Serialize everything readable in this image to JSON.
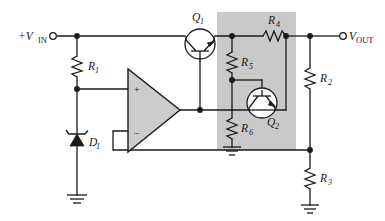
{
  "figure": {
    "name": "series-voltage-regulator-with-current-limiting",
    "background_color": "#ffffff",
    "line_color": "#1a1a1a",
    "shade_color": "#c9c9c9",
    "opamp_fill": "#cccccc"
  },
  "terminals": {
    "input": {
      "label": "+V",
      "subscript": "IN",
      "full": "+VIN"
    },
    "output": {
      "label": "V",
      "subscript": "OUT",
      "full": "VOUT"
    }
  },
  "components": {
    "r1": {
      "label": "R",
      "subscript": "1",
      "full": "R1",
      "type": "resistor",
      "orientation": "vertical"
    },
    "r2": {
      "label": "R",
      "subscript": "2",
      "full": "R2",
      "type": "resistor",
      "orientation": "vertical"
    },
    "r3": {
      "label": "R",
      "subscript": "3",
      "full": "R3",
      "type": "resistor",
      "orientation": "vertical"
    },
    "r4": {
      "label": "R",
      "subscript": "4",
      "full": "R4",
      "type": "resistor",
      "orientation": "horizontal"
    },
    "r5": {
      "label": "R",
      "subscript": "5",
      "full": "R5",
      "type": "resistor",
      "orientation": "vertical"
    },
    "r6": {
      "label": "R",
      "subscript": "6",
      "full": "R6",
      "type": "resistor",
      "orientation": "vertical"
    },
    "d1": {
      "label": "D",
      "subscript": "1",
      "full": "D1",
      "type": "zener-diode"
    },
    "q1": {
      "label": "Q",
      "subscript": "1",
      "full": "Q1",
      "type": "npn-transistor"
    },
    "q2": {
      "label": "Q",
      "subscript": "2",
      "full": "Q2",
      "type": "npn-transistor"
    },
    "opamp": {
      "type": "operational-amplifier",
      "plus_pin": "+",
      "minus_pin": "−"
    },
    "grounds": [
      "ground-d1",
      "ground-r6",
      "ground-r3"
    ]
  }
}
